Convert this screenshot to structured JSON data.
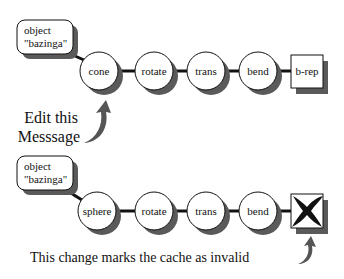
{
  "diagram": {
    "top_row": {
      "object_box": {
        "line1": "object",
        "line2": "\"bazinga\""
      },
      "nodes": [
        "cone",
        "rotate",
        "trans",
        "bend"
      ],
      "result_box": "b-rep"
    },
    "annotation_top": {
      "line1": "Edit this",
      "line2": "Messsage"
    },
    "bottom_row": {
      "object_box": {
        "line1": "object",
        "line2": "\"bazinga\""
      },
      "nodes": [
        "sphere",
        "rotate",
        "trans",
        "bend"
      ],
      "result_box": "invalidated-cache-x"
    },
    "annotation_bottom": "This change marks the cache as invalid"
  },
  "colors": {
    "stroke": "#111111",
    "shadow": "#5a5a5a",
    "fill": "#ffffff",
    "arrow": "#555555"
  }
}
